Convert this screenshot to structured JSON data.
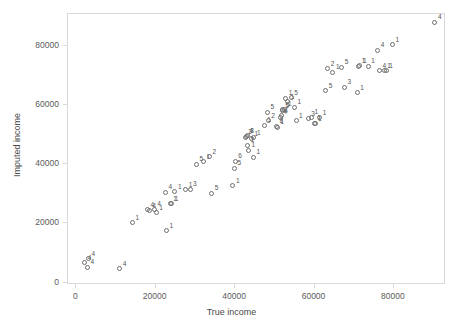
{
  "chart_data": {
    "type": "scatter",
    "title": "",
    "xlabel": "True income",
    "ylabel": "Imputed income",
    "xlim": [
      -1000,
      94000
    ],
    "ylim": [
      -2000,
      91000
    ],
    "grid": false,
    "legend": null,
    "xticks": [
      0,
      20000,
      40000,
      60000,
      80000
    ],
    "xticklabels": [
      "0",
      "20000",
      "40000",
      "60000",
      "80000"
    ],
    "yticks": [
      0,
      20000,
      40000,
      60000,
      80000
    ],
    "yticklabels": [
      "0",
      "20000",
      "40000",
      "60000",
      "80000"
    ],
    "marker": "open-circle",
    "marker_color": "#6e6e6e",
    "point_label_note": "each point is annotated with an imputation/group count label",
    "points": [
      {
        "x": 2400,
        "y": 6400,
        "label": "4"
      },
      {
        "x": 3100,
        "y": 4900,
        "label": "4"
      },
      {
        "x": 3300,
        "y": 7700,
        "label": "4"
      },
      {
        "x": 11200,
        "y": 4300,
        "label": "4"
      },
      {
        "x": 14400,
        "y": 19800,
        "label": "1"
      },
      {
        "x": 18200,
        "y": 24300,
        "label": "4"
      },
      {
        "x": 18600,
        "y": 24000,
        "label": "4"
      },
      {
        "x": 19900,
        "y": 24400,
        "label": "4"
      },
      {
        "x": 20400,
        "y": 23200,
        "label": "1"
      },
      {
        "x": 22700,
        "y": 30100,
        "label": "4"
      },
      {
        "x": 23000,
        "y": 17200,
        "label": "1"
      },
      {
        "x": 23900,
        "y": 26300,
        "label": "1"
      },
      {
        "x": 24300,
        "y": 26300,
        "label": "1"
      },
      {
        "x": 25100,
        "y": 30400,
        "label": "1"
      },
      {
        "x": 27800,
        "y": 31000,
        "label": "1"
      },
      {
        "x": 28900,
        "y": 31200,
        "label": "3"
      },
      {
        "x": 30500,
        "y": 39600,
        "label": "5"
      },
      {
        "x": 32300,
        "y": 40500,
        "label": "1"
      },
      {
        "x": 33800,
        "y": 42200,
        "label": "2"
      },
      {
        "x": 34400,
        "y": 29800,
        "label": "5"
      },
      {
        "x": 39700,
        "y": 32300,
        "label": "1"
      },
      {
        "x": 40100,
        "y": 38200,
        "label": "5"
      },
      {
        "x": 40300,
        "y": 40600,
        "label": "6"
      },
      {
        "x": 42800,
        "y": 48700,
        "label": "2"
      },
      {
        "x": 43100,
        "y": 49000,
        "label": "4"
      },
      {
        "x": 43300,
        "y": 49200,
        "label": "3"
      },
      {
        "x": 43400,
        "y": 46100,
        "label": "1"
      },
      {
        "x": 43600,
        "y": 44400,
        "label": "1"
      },
      {
        "x": 44400,
        "y": 48200,
        "label": "1"
      },
      {
        "x": 44900,
        "y": 42000,
        "label": "1"
      },
      {
        "x": 45000,
        "y": 48600,
        "label": "1"
      },
      {
        "x": 47600,
        "y": 52800,
        "label": "1"
      },
      {
        "x": 48400,
        "y": 57100,
        "label": "5"
      },
      {
        "x": 48600,
        "y": 54300,
        "label": "2"
      },
      {
        "x": 50700,
        "y": 52400,
        "label": "8"
      },
      {
        "x": 50900,
        "y": 52100,
        "label": "1"
      },
      {
        "x": 51600,
        "y": 55500,
        "label": "4"
      },
      {
        "x": 51900,
        "y": 56000,
        "label": "4"
      },
      {
        "x": 52100,
        "y": 57600,
        "label": "5"
      },
      {
        "x": 52300,
        "y": 58000,
        "label": "5"
      },
      {
        "x": 52800,
        "y": 58100,
        "label": "1"
      },
      {
        "x": 53000,
        "y": 61900,
        "label": "1"
      },
      {
        "x": 53500,
        "y": 60700,
        "label": "1"
      },
      {
        "x": 54400,
        "y": 62000,
        "label": "5"
      },
      {
        "x": 55200,
        "y": 58800,
        "label": "1"
      },
      {
        "x": 55600,
        "y": 54200,
        "label": "1"
      },
      {
        "x": 58700,
        "y": 55000,
        "label": "3"
      },
      {
        "x": 59500,
        "y": 55400,
        "label": "1"
      },
      {
        "x": 60200,
        "y": 53500,
        "label": "1"
      },
      {
        "x": 60400,
        "y": 53300,
        "label": "1"
      },
      {
        "x": 61600,
        "y": 55300,
        "label": "1"
      },
      {
        "x": 63100,
        "y": 64400,
        "label": "5"
      },
      {
        "x": 63600,
        "y": 71900,
        "label": "2"
      },
      {
        "x": 64900,
        "y": 70700,
        "label": "1"
      },
      {
        "x": 67100,
        "y": 72400,
        "label": "5"
      },
      {
        "x": 67800,
        "y": 65600,
        "label": "3"
      },
      {
        "x": 71000,
        "y": 63700,
        "label": "1"
      },
      {
        "x": 71400,
        "y": 72700,
        "label": "1"
      },
      {
        "x": 71700,
        "y": 72800,
        "label": "1"
      },
      {
        "x": 73800,
        "y": 72700,
        "label": "1"
      },
      {
        "x": 76200,
        "y": 78000,
        "label": "4"
      },
      {
        "x": 76600,
        "y": 71200,
        "label": "4"
      },
      {
        "x": 77800,
        "y": 71100,
        "label": "1"
      },
      {
        "x": 78300,
        "y": 71100,
        "label": "1"
      },
      {
        "x": 79900,
        "y": 80000,
        "label": "1"
      },
      {
        "x": 90600,
        "y": 87500,
        "label": "4"
      }
    ]
  }
}
